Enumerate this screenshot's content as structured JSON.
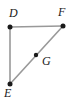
{
  "figure": {
    "type": "geometry-diagram",
    "shape": "right-triangle",
    "background_color": "#ffffff",
    "line_color": "#999999",
    "point_color": "#1a1a1a",
    "label_color": "#1a1a1a",
    "canvas": {
      "width": 75,
      "height": 104
    },
    "vertices": [
      {
        "id": "D",
        "label": "D",
        "x": 10,
        "y": 27,
        "label_x": 9,
        "label_y": 7,
        "role": "right-angle-vertex"
      },
      {
        "id": "F",
        "label": "F",
        "x": 63,
        "y": 26,
        "label_x": 58,
        "label_y": 6,
        "role": "triangle-vertex"
      },
      {
        "id": "E",
        "label": "E",
        "x": 10,
        "y": 84,
        "label_x": 4,
        "label_y": 87,
        "role": "triangle-vertex"
      },
      {
        "id": "G",
        "label": "G",
        "x": 36,
        "y": 55,
        "label_x": 42,
        "label_y": 55,
        "role": "point-on-segment-EF"
      }
    ],
    "segments": [
      {
        "id": "DF",
        "from": "D",
        "to": "F",
        "x1": 10,
        "y1": 27,
        "x2": 63,
        "y2": 26
      },
      {
        "id": "DE",
        "from": "D",
        "to": "E",
        "x1": 10,
        "y1": 27,
        "x2": 10,
        "y2": 84
      },
      {
        "id": "EF",
        "from": "E",
        "to": "F",
        "x1": 10,
        "y1": 84,
        "x2": 63,
        "y2": 26
      }
    ]
  }
}
